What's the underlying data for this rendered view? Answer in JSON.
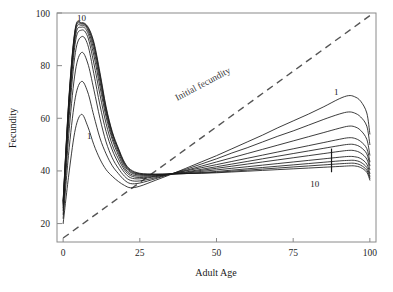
{
  "figure": {
    "background": "#ffffff",
    "frame_color": "#8a8a8a",
    "curve_color": "#1a1a1a",
    "dashed_color": "#555555",
    "caption_fragment": ""
  },
  "chart_data": {
    "type": "line",
    "title": "",
    "xlabel": "Adult Age",
    "ylabel": "Fecundity",
    "xlim": [
      -2,
      102
    ],
    "ylim": [
      13,
      100
    ],
    "xticks": [
      0,
      25,
      50,
      75,
      100
    ],
    "yticks": [
      20,
      40,
      60,
      80,
      100
    ],
    "xtick_labels": [
      "0",
      "25",
      "50",
      "75",
      "100"
    ],
    "ytick_labels": [
      "20",
      "40",
      "60",
      "80",
      "100"
    ],
    "grid": false,
    "legend": "none",
    "annotations": [
      {
        "text": "Initial fecundity",
        "x": 46,
        "y": 72,
        "rotation": -28,
        "name": "initial-fecundity-label"
      },
      {
        "text": "10",
        "x": 6,
        "y": 97,
        "name": "curve-10-top-label"
      },
      {
        "text": "1",
        "x": 8.5,
        "y": 52,
        "name": "curve-1-top-label"
      },
      {
        "text": "1",
        "x": 89,
        "y": 69,
        "name": "curve-1-right-label"
      },
      {
        "text": "10",
        "x": 82,
        "y": 34,
        "name": "curve-10-right-label"
      }
    ],
    "reference_line": {
      "name": "initial-fecundity-line",
      "style": "dashed",
      "x": [
        0,
        100
      ],
      "y": [
        14.5,
        99
      ]
    },
    "series": [
      {
        "name": "cohort-1",
        "x": [
          0,
          2,
          4,
          6,
          8,
          10,
          12,
          14,
          16,
          18,
          20,
          22,
          25,
          30,
          35,
          40,
          45,
          50,
          55,
          60,
          65,
          70,
          75,
          80,
          85,
          90,
          93,
          95,
          97,
          99,
          100
        ],
        "values": [
          20,
          40,
          56,
          61.5,
          57,
          50,
          44.5,
          40.5,
          38,
          36,
          34.5,
          33.6,
          34.2,
          36.4,
          38.6,
          41,
          43.4,
          45.8,
          48.4,
          51,
          53.6,
          56.4,
          59,
          61.6,
          64.4,
          67.4,
          68.6,
          68.2,
          66.5,
          62,
          54
        ]
      },
      {
        "name": "cohort-2",
        "x": [
          0,
          2,
          4,
          6,
          8,
          10,
          12,
          14,
          16,
          18,
          20,
          22,
          25,
          30,
          35,
          40,
          45,
          50,
          55,
          60,
          65,
          70,
          75,
          80,
          85,
          90,
          93,
          95,
          97,
          99,
          100
        ],
        "values": [
          22,
          49,
          68,
          74,
          70,
          61,
          52.5,
          46.5,
          42,
          39,
          36.5,
          35.2,
          35.4,
          37,
          38.8,
          40.6,
          42.6,
          44.6,
          46.8,
          48.8,
          51,
          53.2,
          55.2,
          57.4,
          59.6,
          61.6,
          62.4,
          62,
          60.5,
          57,
          50
        ]
      },
      {
        "name": "cohort-3",
        "x": [
          0,
          2,
          4,
          6,
          8,
          10,
          12,
          14,
          16,
          18,
          20,
          22,
          25,
          30,
          35,
          40,
          45,
          50,
          55,
          60,
          65,
          70,
          75,
          80,
          85,
          90,
          93,
          95,
          97,
          99,
          100
        ],
        "values": [
          23.5,
          56,
          78,
          85,
          81,
          71,
          60,
          51,
          45,
          41,
          38,
          36.4,
          36.2,
          37.4,
          38.8,
          40.2,
          41.8,
          43.4,
          45,
          46.6,
          48.2,
          49.8,
          51.4,
          53,
          54.6,
          56.2,
          57,
          56.8,
          55.4,
          52,
          46
        ]
      },
      {
        "name": "cohort-4",
        "x": [
          0,
          2,
          4,
          6,
          8,
          10,
          12,
          14,
          16,
          18,
          20,
          22,
          25,
          30,
          35,
          40,
          45,
          50,
          55,
          60,
          65,
          70,
          75,
          80,
          85,
          90,
          93,
          95,
          97,
          99,
          100
        ],
        "values": [
          25,
          61,
          85,
          91,
          88,
          77,
          65,
          55,
          48,
          43,
          39.4,
          37.4,
          37,
          37.8,
          38.8,
          40,
          41.2,
          42.4,
          43.6,
          44.8,
          46,
          47.2,
          48.4,
          49.6,
          50.8,
          52,
          52.6,
          52.4,
          51.2,
          48.5,
          43.5
        ]
      },
      {
        "name": "cohort-5",
        "x": [
          0,
          2,
          4,
          6,
          8,
          10,
          12,
          14,
          16,
          18,
          20,
          22,
          25,
          30,
          35,
          40,
          45,
          50,
          55,
          60,
          65,
          70,
          75,
          80,
          85,
          90,
          93,
          95,
          97,
          99,
          100
        ],
        "values": [
          26,
          64,
          89,
          93.5,
          91,
          81,
          69,
          58,
          50,
          44.6,
          40.4,
          38.2,
          37.5,
          38,
          38.8,
          39.6,
          40.6,
          41.6,
          42.6,
          43.6,
          44.6,
          45.6,
          46.6,
          47.6,
          48.6,
          49.6,
          50.1,
          50,
          49,
          46.5,
          42
        ]
      },
      {
        "name": "cohort-6",
        "x": [
          0,
          2,
          4,
          6,
          8,
          10,
          12,
          14,
          16,
          18,
          20,
          22,
          25,
          30,
          35,
          40,
          45,
          50,
          55,
          60,
          65,
          70,
          75,
          80,
          85,
          90,
          93,
          95,
          97,
          99,
          100
        ],
        "values": [
          27,
          66,
          91,
          94.6,
          92.6,
          84,
          72,
          60.5,
          52,
          46,
          41.2,
          38.8,
          38,
          38.2,
          38.8,
          39.4,
          40.2,
          41,
          41.8,
          42.6,
          43.4,
          44.2,
          45,
          45.8,
          46.6,
          47.4,
          47.8,
          47.7,
          46.8,
          44.5,
          40.5
        ]
      },
      {
        "name": "cohort-7",
        "x": [
          0,
          2,
          4,
          6,
          8,
          10,
          12,
          14,
          16,
          18,
          20,
          22,
          25,
          30,
          35,
          40,
          45,
          50,
          55,
          60,
          65,
          70,
          75,
          80,
          85,
          90,
          93,
          95,
          97,
          99,
          100
        ],
        "values": [
          27.5,
          67.5,
          92.5,
          95.3,
          93.6,
          86,
          74,
          62,
          53,
          47,
          42,
          39.4,
          38.4,
          38.4,
          38.8,
          39.2,
          39.8,
          40.4,
          41,
          41.6,
          42.2,
          42.8,
          43.4,
          44,
          44.6,
          45.2,
          45.5,
          45.4,
          44.7,
          42.6,
          39
        ]
      },
      {
        "name": "cohort-8",
        "x": [
          0,
          2,
          4,
          6,
          8,
          10,
          12,
          14,
          16,
          18,
          20,
          22,
          25,
          30,
          35,
          40,
          45,
          50,
          55,
          60,
          65,
          70,
          75,
          80,
          85,
          90,
          93,
          95,
          97,
          99,
          100
        ],
        "values": [
          28,
          68.5,
          93.4,
          95.8,
          94.2,
          87.5,
          75.5,
          63,
          54,
          47.8,
          42.6,
          39.8,
          38.7,
          38.6,
          38.8,
          39,
          39.4,
          39.8,
          40.3,
          40.8,
          41.3,
          41.8,
          42.3,
          42.8,
          43.3,
          43.8,
          44,
          44,
          43.3,
          41.3,
          38
        ]
      },
      {
        "name": "cohort-9",
        "x": [
          0,
          2,
          4,
          6,
          8,
          10,
          12,
          14,
          16,
          18,
          20,
          22,
          25,
          30,
          35,
          40,
          45,
          50,
          55,
          60,
          65,
          70,
          75,
          80,
          85,
          90,
          93,
          95,
          97,
          99,
          100
        ],
        "values": [
          28.4,
          69.2,
          94,
          96.1,
          94.6,
          88.4,
          76.6,
          63.8,
          54.6,
          48.3,
          43,
          40.2,
          38.9,
          38.7,
          38.8,
          39,
          39.2,
          39.5,
          39.9,
          40.3,
          40.7,
          41.1,
          41.5,
          41.9,
          42.3,
          42.7,
          42.9,
          42.9,
          42.2,
          40.3,
          37.2
        ]
      },
      {
        "name": "cohort-10",
        "x": [
          0,
          2,
          4,
          6,
          8,
          10,
          12,
          14,
          16,
          18,
          20,
          22,
          25,
          30,
          35,
          40,
          45,
          50,
          55,
          60,
          65,
          70,
          75,
          80,
          85,
          90,
          93,
          95,
          97,
          99,
          100
        ],
        "values": [
          28.7,
          69.8,
          94.4,
          96.3,
          94.9,
          89,
          77.4,
          64.4,
          55,
          48.7,
          43.3,
          40.5,
          39.1,
          38.8,
          38.9,
          39,
          39.1,
          39.3,
          39.6,
          39.9,
          40.2,
          40.5,
          40.8,
          41.1,
          41.4,
          41.7,
          41.9,
          41.9,
          41.3,
          39.5,
          36.5
        ]
      }
    ],
    "right_drop_marker": {
      "name": "right-vertical-marker",
      "x": 87.5,
      "y0": 39.5,
      "y1": 48.5
    }
  }
}
